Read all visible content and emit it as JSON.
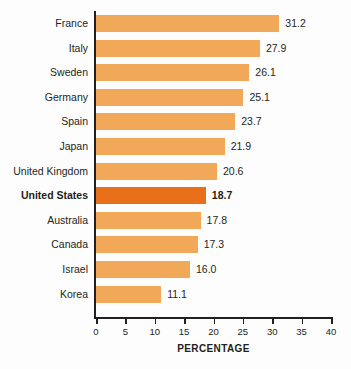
{
  "chart_data": {
    "type": "bar",
    "orientation": "horizontal",
    "title": "",
    "xlabel": "PERCENTAGE",
    "ylabel": "",
    "xlim": [
      0,
      40
    ],
    "xticks": [
      0,
      5,
      10,
      15,
      20,
      25,
      30,
      35,
      40
    ],
    "grid": false,
    "legend": null,
    "categories": [
      "France",
      "Italy",
      "Sweden",
      "Germany",
      "Spain",
      "Japan",
      "United Kingdom",
      "United States",
      "Australia",
      "Canada",
      "Israel",
      "Korea"
    ],
    "values": [
      31.2,
      27.9,
      26.1,
      25.1,
      23.7,
      21.9,
      20.6,
      18.7,
      17.8,
      17.3,
      16.0,
      11.1
    ],
    "value_labels": [
      "31.2",
      "27.9",
      "26.1",
      "25.1",
      "23.7",
      "21.9",
      "20.6",
      "18.7",
      "17.8",
      "17.3",
      "16.0",
      "11.1"
    ],
    "highlighted_category": "United States",
    "colors": {
      "bar": "#f2a859",
      "bar_highlight": "#e8701a",
      "axis": "#231f20",
      "text": "#231f20",
      "background": "#fdfdfd"
    }
  }
}
